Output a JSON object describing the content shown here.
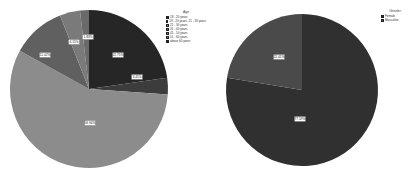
{
  "chart_data": [
    {
      "type": "pie",
      "title": "Age",
      "legend_title": "Age",
      "legend_position": "top-right",
      "categories": [
        "18 - 20 years",
        "19 - 20 years, 21 - 30 years",
        "21 - 30 years",
        "31 - 40 years",
        "41 - 50 years",
        "51 - 60 years",
        "above 60 years"
      ],
      "slices": [
        {
          "label": "22.75%",
          "value": 22.75,
          "color": "#262626"
        },
        {
          "label": "3.41%",
          "value": 3.41,
          "color": "#3c3c3c"
        },
        {
          "label": "56.94%",
          "value": 56.94,
          "color": "#8c8c8c"
        },
        {
          "label": "11.02%",
          "value": 11.02,
          "color": "#606060"
        },
        {
          "label": "4.15%",
          "value": 4.15,
          "color": "#7a7a7a"
        },
        {
          "label": "1.83%",
          "value": 1.83,
          "color": "#6a6a6a"
        }
      ]
    },
    {
      "type": "pie",
      "title": "Gender",
      "legend_title": "Gender",
      "legend_position": "top-right",
      "categories": [
        "Female",
        "Masculine"
      ],
      "slices": [
        {
          "label": "77.59%",
          "value": 77.59,
          "color": "#303030"
        },
        {
          "label": "22.41%",
          "value": 22.41,
          "color": "#4a4a4a"
        }
      ]
    }
  ],
  "legends": {
    "age": {
      "title": "Age",
      "items": [
        {
          "label": "18 - 20 years",
          "color": "#262626"
        },
        {
          "label": "19 - 20 years, 21 - 30 years",
          "color": "#3c3c3c"
        },
        {
          "label": "21 - 30 years",
          "color": "#8c8c8c"
        },
        {
          "label": "31 - 40 years",
          "color": "#606060"
        },
        {
          "label": "41 - 50 years",
          "color": "#7a7a7a"
        },
        {
          "label": "51 - 60 years",
          "color": "#6a6a6a"
        },
        {
          "label": "above 60 years",
          "color": "#151515"
        }
      ]
    },
    "gender": {
      "title": "Gender",
      "items": [
        {
          "label": "Female",
          "color": "#303030"
        },
        {
          "label": "Masculine",
          "color": "#4a4a4a"
        }
      ]
    }
  }
}
